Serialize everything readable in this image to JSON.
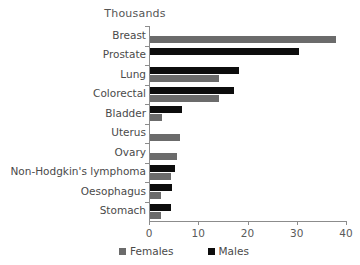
{
  "chart_data": {
    "type": "bar",
    "orientation": "horizontal",
    "title": "Thousands",
    "xlabel": "",
    "ylabel": "",
    "xlim": [
      0,
      40
    ],
    "xticks": [
      0,
      10,
      20,
      30,
      40
    ],
    "grid": false,
    "legend_position": "bottom",
    "categories": [
      "Breast",
      "Prostate",
      "Lung",
      "Colorectal",
      "Bladder",
      "Uterus",
      "Ovary",
      "Non-Hodgkin's lymphoma",
      "Oesophagus",
      "Stomach"
    ],
    "series": [
      {
        "name": "Males",
        "color": "#0d0d0d",
        "values": [
          0,
          30.2,
          18.0,
          17.0,
          6.5,
          0,
          0,
          5.0,
          4.4,
          4.2
        ]
      },
      {
        "name": "Females",
        "color": "#6b6b6b",
        "values": [
          37.8,
          0,
          14.0,
          14.0,
          2.5,
          6.0,
          5.5,
          4.3,
          2.2,
          2.3
        ]
      }
    ]
  },
  "legend": {
    "items": [
      {
        "label": "Females",
        "color": "#6b6b6b"
      },
      {
        "label": "Males",
        "color": "#0d0d0d"
      }
    ]
  }
}
